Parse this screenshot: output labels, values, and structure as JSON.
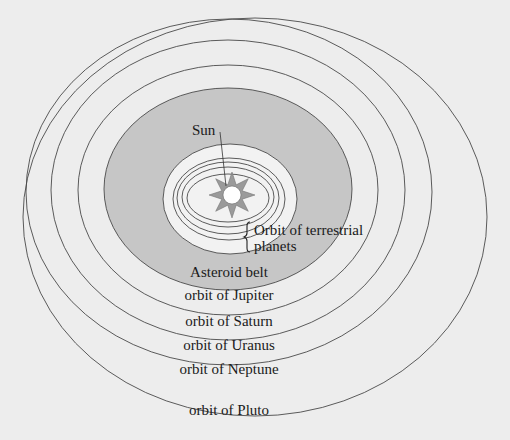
{
  "diagram": {
    "type": "solar-system-orbits",
    "colors": {
      "background": "#ededed",
      "asteroid_belt_fill": "#c6c6c6",
      "inner_region_fill": "#f2f2f2",
      "orbit_stroke": "#4a4a4a",
      "sun_rays": "#9a9a9a",
      "sun_disc": "#ffffff"
    },
    "labels": {
      "sun": "Sun",
      "terrestrial_line1": "Orbit of terrestrial",
      "terrestrial_line2": "planets",
      "asteroid_belt": "Asteroid belt",
      "jupiter": "orbit of Jupiter",
      "saturn": "orbit of Saturn",
      "uranus": "orbit of Uranus",
      "neptune": "orbit of Neptune",
      "pluto": "orbit of Pluto"
    },
    "orbits": [
      {
        "name": "Pluto",
        "cx": 255,
        "cy": 217,
        "rx": 232,
        "ry": 199
      },
      {
        "name": "Neptune",
        "cx": 229,
        "cy": 192,
        "rx": 203,
        "ry": 173
      },
      {
        "name": "Uranus",
        "cx": 228,
        "cy": 190,
        "rx": 177,
        "ry": 150
      },
      {
        "name": "Saturn",
        "cx": 228,
        "cy": 190,
        "rx": 150,
        "ry": 125
      },
      {
        "name": "Jupiter / Asteroid belt outer",
        "cx": 228,
        "cy": 189,
        "rx": 124,
        "ry": 101
      },
      {
        "name": "Asteroid belt inner",
        "cx": 230,
        "cy": 199,
        "rx": 67,
        "ry": 55
      },
      {
        "name": "Mars",
        "cx": 229,
        "cy": 199,
        "rx": 56,
        "ry": 41
      },
      {
        "name": "Earth",
        "cx": 228,
        "cy": 198,
        "rx": 51,
        "ry": 36
      },
      {
        "name": "Venus",
        "cx": 228,
        "cy": 197,
        "rx": 46,
        "ry": 30
      },
      {
        "name": "Mercury",
        "cx": 228,
        "cy": 198,
        "rx": 41,
        "ry": 24
      }
    ]
  }
}
